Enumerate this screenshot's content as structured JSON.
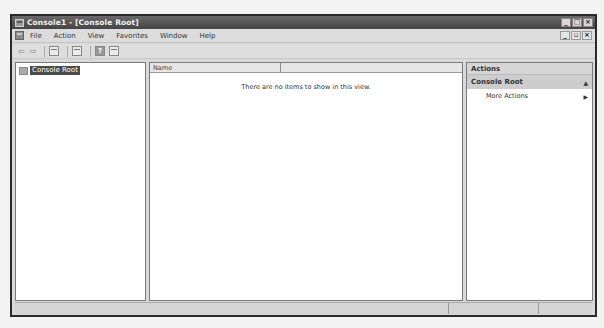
{
  "window": {
    "title": "Console1 - [Console Root]",
    "controls": {
      "minimize": "_",
      "maximize": "□",
      "close": "×"
    }
  },
  "menubar": {
    "items": [
      "File",
      "Action",
      "View",
      "Favorites",
      "Window",
      "Help"
    ],
    "mdi_controls": {
      "minimize": "_",
      "restore": "▫",
      "close": "×"
    }
  },
  "toolbar": {
    "back_icon": "⇦",
    "forward_icon": "⇨",
    "help_label": "?"
  },
  "tree": {
    "root_label": "Console Root"
  },
  "list": {
    "columns": [
      "Name",
      ""
    ],
    "empty_message": "There are no items to show in this view."
  },
  "actions": {
    "header": "Actions",
    "group_title": "Console Root",
    "collapse_glyph": "▲",
    "items": [
      {
        "label": "More Actions",
        "arrow": "▶"
      }
    ]
  },
  "statusbar": {
    "segments": [
      "",
      "",
      ""
    ]
  }
}
